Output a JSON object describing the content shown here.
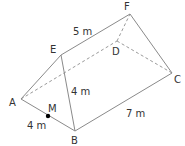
{
  "diagram": {
    "type": "triangular prism",
    "vertices": {
      "A": {
        "label": "A",
        "x": 21,
        "y": 99,
        "lx": 9,
        "ly": 106
      },
      "B": {
        "label": "B",
        "x": 75,
        "y": 131,
        "lx": 71,
        "ly": 144
      },
      "C": {
        "label": "C",
        "x": 172,
        "y": 73,
        "lx": 174,
        "ly": 83
      },
      "D": {
        "label": "D",
        "x": 117,
        "y": 41,
        "lx": 112,
        "ly": 55
      },
      "E": {
        "label": "E",
        "x": 61,
        "y": 55,
        "lx": 50,
        "ly": 53
      },
      "F": {
        "label": "F",
        "x": 130,
        "y": 14,
        "lx": 124,
        "ly": 10
      },
      "M": {
        "label": "M",
        "x": 48,
        "y": 116,
        "lx": 48,
        "ly": 112
      }
    },
    "visible_edges": [
      "A-B",
      "B-C",
      "A-E",
      "E-B",
      "E-F",
      "F-C"
    ],
    "hidden_edges": [
      "A-D",
      "D-C",
      "D-F"
    ],
    "measurements": [
      {
        "id": "EF",
        "text": "5 m",
        "x": 73,
        "y": 35
      },
      {
        "id": "EB",
        "text": "4 m",
        "x": 71,
        "y": 95
      },
      {
        "id": "BC",
        "text": "7 m",
        "x": 126,
        "y": 117
      },
      {
        "id": "AB",
        "text": "4 m",
        "x": 27,
        "y": 129
      }
    ],
    "point_color": "#000000",
    "edge_color": "#8a8a8a"
  }
}
